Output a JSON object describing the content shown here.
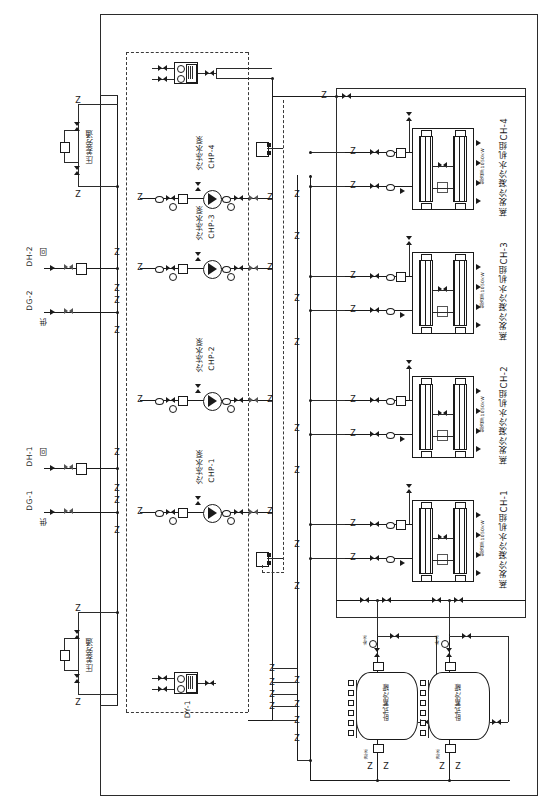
{
  "diagram": {
    "type": "hvac-chiller-plant-schematic",
    "orientation": "rotated-90-ccw-labels"
  },
  "chillers": [
    {
      "id": "CH-4",
      "label": "蒸发冷凝冷水机组CH-4",
      "capacity": "制冷量:1050kW"
    },
    {
      "id": "CH-3",
      "label": "蒸发冷凝冷水机组CH-3",
      "capacity": "制冷量:1050kW"
    },
    {
      "id": "CH-2",
      "label": "蒸发冷凝冷水机组CH-2",
      "capacity": "制冷量:1050kW"
    },
    {
      "id": "CH-1",
      "label": "蒸发冷凝冷水机组CH-1",
      "capacity": "制冷量:1050kW"
    }
  ],
  "pumps": [
    {
      "id": "CHP-4",
      "label": "冷冻水泵",
      "tag": "CHP-4"
    },
    {
      "id": "CHP-3",
      "label": "冷冻水泵",
      "tag": "CHP-3"
    },
    {
      "id": "CHP-2",
      "label": "冷冻水泵",
      "tag": "CHP-2"
    },
    {
      "id": "CHP-1",
      "label": "冷冻水泵",
      "tag": "CHP-1"
    }
  ],
  "mains": [
    {
      "tag": "DH-2",
      "label": "回",
      "desc": "回水管 DH-2"
    },
    {
      "tag": "DG-2",
      "label": "供",
      "desc": "供水管 DG-2"
    },
    {
      "tag": "DH-1",
      "label": "回",
      "desc": "回水管 DH-1"
    },
    {
      "tag": "DG-1",
      "label": "供",
      "desc": "供水管 DG-1"
    }
  ],
  "bypass": [
    {
      "label": "压差旁通",
      "position": "top"
    },
    {
      "label": "压差旁通",
      "position": "bottom"
    }
  ],
  "equipment": {
    "dy_unit": "DY-1",
    "tanks": [
      {
        "label": "卧式蓄冷罐",
        "tag": "1"
      },
      {
        "label": "卧式蓄冷罐",
        "tag": "2"
      }
    ]
  },
  "tank_ports": {
    "top_note": "补水",
    "bottom_note": "泄水"
  },
  "legend": {
    "valve": "阀门",
    "check_valve": "止回阀",
    "pump_symbol": "水泵",
    "flex_joint": "软接头",
    "strainer": "过滤器",
    "gauge": "压力表"
  },
  "colors": {
    "line": "#1a1a1a",
    "dash": "#3a3a3a",
    "fill": "#ffffff"
  }
}
